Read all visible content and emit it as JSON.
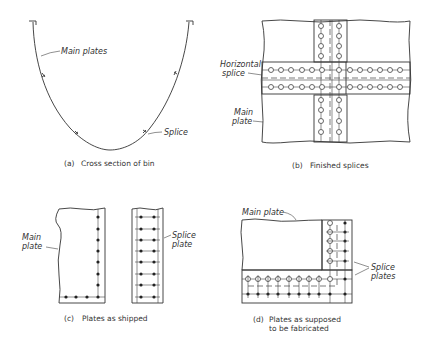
{
  "figure": {
    "panels": [
      {
        "id": "a",
        "caption_letter": "(a)",
        "caption_text": "Cross section of bin",
        "labels": {
          "main_plates": "Main plates",
          "splice": "Splice"
        }
      },
      {
        "id": "b",
        "caption_letter": "(b)",
        "caption_text": "Finished splices",
        "labels": {
          "horizontal_splice_1": "Horizontal",
          "horizontal_splice_2": "splice",
          "main_plate_1": "Main",
          "main_plate_2": "plate"
        }
      },
      {
        "id": "c",
        "caption_letter": "(c)",
        "caption_text": "Plates as shipped",
        "labels": {
          "main_plate_1": "Main",
          "main_plate_2": "plate",
          "splice_plate_1": "Splice",
          "splice_plate_2": "plate"
        }
      },
      {
        "id": "d",
        "caption_letter": "(d)",
        "caption_text_1": "Plates as supposed",
        "caption_text_2": "to be fabricated",
        "labels": {
          "main_plate": "Main plate",
          "splice_plates_1": "Splice",
          "splice_plates_2": "plates"
        }
      }
    ]
  }
}
